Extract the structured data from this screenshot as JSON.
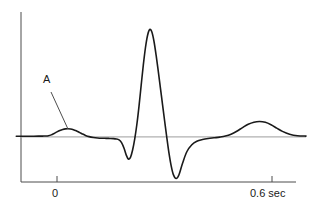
{
  "figure": {
    "background_color": "#ffffff",
    "axis_color": "#4d4d4d",
    "trace_color": "#1a1a1a",
    "baseline_color": "#b0b0b0",
    "text_color": "#1a1a1a"
  },
  "axes": {
    "x_axis_label": "",
    "y_axis_label": "",
    "x_ticks": [
      {
        "id": "t0",
        "label": "0",
        "value": 0
      },
      {
        "id": "t06",
        "label": "0.6 sec",
        "value": 0.6
      }
    ]
  },
  "annotations": [
    {
      "id": "a",
      "label": "A",
      "target": "first upward deflection (P wave)"
    }
  ],
  "chart_data": {
    "type": "line",
    "title": "",
    "subtitle": "",
    "xlabel": "sec",
    "ylabel": "",
    "xlim": [
      -0.08,
      0.73
    ],
    "ylim": [
      -1.3,
      3.3
    ],
    "grid": false,
    "legend": false,
    "legend_position": "none",
    "baseline_y": 0,
    "annotations": [
      {
        "text": "A",
        "x": 0.02,
        "y": 2.0,
        "points_to_x": 0.063,
        "points_to_y": 0.22
      }
    ],
    "tick_labels": {
      "x": [
        "0",
        "0.6 sec"
      ]
    },
    "series": [
      {
        "name": "waveform",
        "x": [
          -0.082,
          -0.06,
          -0.04,
          -0.02,
          -0.008,
          0.0,
          0.008,
          0.016,
          0.024,
          0.032,
          0.04,
          0.048,
          0.056,
          0.063,
          0.07,
          0.078,
          0.086,
          0.094,
          0.102,
          0.112,
          0.122,
          0.134,
          0.146,
          0.158,
          0.17,
          0.18,
          0.19,
          0.198,
          0.206,
          0.213,
          0.22,
          0.226,
          0.232,
          0.238,
          0.244,
          0.25,
          0.256,
          0.262,
          0.268,
          0.274,
          0.28,
          0.286,
          0.292,
          0.298,
          0.304,
          0.31,
          0.316,
          0.322,
          0.328,
          0.334,
          0.34,
          0.346,
          0.352,
          0.358,
          0.366,
          0.374,
          0.384,
          0.396,
          0.41,
          0.424,
          0.44,
          0.456,
          0.472,
          0.488,
          0.504,
          0.52,
          0.536,
          0.552,
          0.568,
          0.584,
          0.6,
          0.616,
          0.632,
          0.648,
          0.664,
          0.684,
          0.706,
          0.73
        ],
        "y": [
          0.015,
          0.015,
          0.015,
          0.018,
          0.02,
          0.022,
          0.03,
          0.055,
          0.095,
          0.14,
          0.18,
          0.21,
          0.228,
          0.232,
          0.225,
          0.205,
          0.172,
          0.13,
          0.088,
          0.04,
          0.005,
          -0.02,
          -0.035,
          -0.042,
          -0.045,
          -0.048,
          -0.052,
          -0.062,
          -0.09,
          -0.17,
          -0.33,
          -0.52,
          -0.64,
          -0.59,
          -0.38,
          -0.06,
          0.36,
          0.88,
          1.48,
          2.06,
          2.56,
          2.92,
          3.085,
          3.01,
          2.74,
          2.34,
          1.88,
          1.4,
          0.92,
          0.44,
          -0.03,
          -0.47,
          -0.83,
          -1.08,
          -1.2,
          -1.09,
          -0.76,
          -0.43,
          -0.23,
          -0.13,
          -0.08,
          -0.05,
          -0.03,
          -0.01,
          0.02,
          0.075,
          0.16,
          0.265,
          0.36,
          0.42,
          0.44,
          0.415,
          0.345,
          0.25,
          0.155,
          0.075,
          0.03,
          0.02
        ]
      }
    ]
  }
}
